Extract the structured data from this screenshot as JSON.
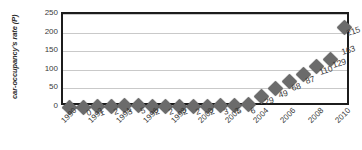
{
  "chart_data": {
    "type": "line",
    "title": "",
    "xlabel": "",
    "ylabel": "car-occupancy's rate (P)",
    "ylim": [
      0,
      250
    ],
    "ytick_labels": [
      "0",
      "50",
      "100",
      "150",
      "200",
      "250"
    ],
    "ytick_values": [
      0,
      50,
      100,
      150,
      200,
      250
    ],
    "grid": true,
    "legend": "none",
    "categories": [
      "1990",
      "1991",
      "1992",
      "1993",
      "1994",
      "1995",
      "1996",
      "1997",
      "1998",
      "1999",
      "2000",
      "2001",
      "2002",
      "2003",
      "2004",
      "2005",
      "2006",
      "2007",
      "2008",
      "2009",
      "2010"
    ],
    "xtick_labels": [
      "1990",
      "1992",
      "1994",
      "1996",
      "1998",
      "2000",
      "2002",
      "2004",
      "2006",
      "2008",
      "2010"
    ],
    "xtick_indices": [
      0,
      2,
      4,
      6,
      8,
      10,
      12,
      14,
      16,
      18,
      20
    ],
    "values": [
      0,
      0,
      1,
      2,
      3,
      5,
      2,
      2,
      2,
      2,
      2,
      3,
      5,
      6,
      29,
      49,
      68,
      87,
      110,
      129,
      215
    ],
    "point_labels": [
      "",
      "0",
      "1",
      "2",
      "3",
      "5",
      "2",
      "2",
      "2",
      "2",
      "2",
      "3",
      "5",
      "6",
      "29",
      "49",
      "68",
      "87",
      "110",
      "129",
      "215"
    ],
    "extra_labels": [
      {
        "text": "163",
        "x_index": 19.6,
        "value": 163
      }
    ],
    "colors": {
      "marker": "#6b6b6b",
      "frame": "#1c1c1c",
      "gridline": "#c9c9c9",
      "text": "#3a3a3a",
      "background": "#ffffff"
    }
  }
}
